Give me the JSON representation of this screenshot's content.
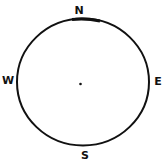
{
  "compass": {
    "north": "N",
    "south": "S",
    "east": "E",
    "west": "W",
    "stroke_color": "#111111"
  }
}
